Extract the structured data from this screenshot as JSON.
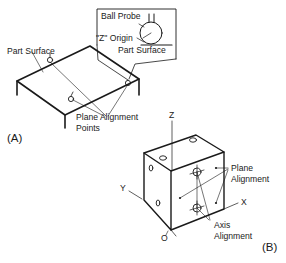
{
  "figure_a": {
    "label": "(A)",
    "part_surface_label": "Part Surface",
    "plane_alignment_label_line1": "Plane Alignment",
    "plane_alignment_label_line2": "Points",
    "inset": {
      "ball_probe": "Ball Probe",
      "z_origin": "\"Z\" Origin",
      "part_surface": "Part Surface"
    }
  },
  "figure_b": {
    "label": "(B)",
    "axis_z": "Z",
    "axis_y": "Y",
    "axis_x": "X",
    "origin": "O",
    "plane_alignment_line1": "Plane",
    "plane_alignment_line2": "Alignment",
    "axis_alignment_line1": "Axis",
    "axis_alignment_line2": "Alignment"
  },
  "colors": {
    "ink": "#1a1a1a",
    "background": "#ffffff"
  }
}
